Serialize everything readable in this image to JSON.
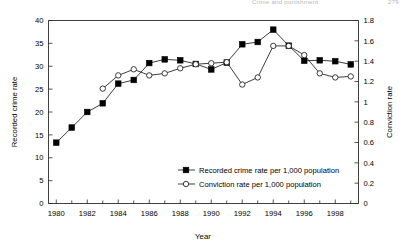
{
  "running_head": {
    "title": "Crime and punishment",
    "page": "279"
  },
  "chart_data": {
    "type": "line",
    "title": "",
    "xlabel": "Year",
    "ylabel": "Recorded crime rate",
    "y2label": "Conviction rate",
    "x": [
      1980,
      1981,
      1982,
      1983,
      1984,
      1985,
      1986,
      1987,
      1988,
      1989,
      1990,
      1991,
      1992,
      1993,
      1994,
      1995,
      1996,
      1997,
      1998,
      1999
    ],
    "xlim": [
      1979.5,
      1999.5
    ],
    "ylim": [
      0,
      40
    ],
    "y2lim": [
      0,
      1.8
    ],
    "ytick_labels": [
      "0",
      "5",
      "10",
      "15",
      "20",
      "25",
      "30",
      "35",
      "40"
    ],
    "ytick_values": [
      0,
      5,
      10,
      15,
      20,
      25,
      30,
      35,
      40
    ],
    "y2tick_labels": [
      "0",
      "0.2",
      "0.4",
      "0.6",
      "0.8",
      "1",
      "1.2",
      "1.4",
      "1.6",
      "1.8"
    ],
    "y2tick_values": [
      0,
      0.2,
      0.4,
      0.6,
      0.8,
      1.0,
      1.2,
      1.4,
      1.6,
      1.8
    ],
    "xtick_labels": [
      "1980",
      "1982",
      "1984",
      "1986",
      "1988",
      "1990",
      "1992",
      "1994",
      "1996",
      "1998"
    ],
    "xtick_values": [
      1980,
      1982,
      1984,
      1986,
      1988,
      1990,
      1992,
      1994,
      1996,
      1998
    ],
    "xtick_minor_values": [
      1981,
      1983,
      1985,
      1987,
      1989,
      1991,
      1993,
      1995,
      1997,
      1999
    ],
    "grid": false,
    "legend_position": "inside-center-lower",
    "series": [
      {
        "name": "Recorded crime rate per 1,000 population",
        "axis": "left",
        "marker": "filled-square",
        "color": "#000000",
        "x": [
          1980,
          1981,
          1982,
          1983,
          1984,
          1985,
          1986,
          1987,
          1988,
          1989,
          1990,
          1991,
          1992,
          1993,
          1994,
          1995,
          1996,
          1997,
          1998,
          1999
        ],
        "values": [
          13.3,
          16.6,
          20.0,
          21.9,
          26.2,
          27.0,
          30.7,
          31.5,
          31.3,
          30.5,
          29.3,
          30.8,
          34.8,
          35.3,
          38.0,
          34.5,
          31.2,
          31.3,
          31.1,
          30.4
        ]
      },
      {
        "name": "Conviction rate per 1,000 population",
        "axis": "right",
        "marker": "open-circle",
        "color": "#ffffff",
        "x": [
          1983,
          1984,
          1985,
          1986,
          1987,
          1988,
          1989,
          1990,
          1991,
          1992,
          1993,
          1994,
          1995,
          1996,
          1997,
          1998,
          1999
        ],
        "values": [
          1.13,
          1.26,
          1.32,
          1.26,
          1.28,
          1.33,
          1.37,
          1.38,
          1.39,
          1.17,
          1.24,
          1.55,
          1.55,
          1.46,
          1.28,
          1.24,
          1.25
        ],
        "values_left_scale": [
          25.1,
          28.1,
          29.3,
          28.0,
          28.5,
          29.6,
          30.5,
          30.6,
          30.9,
          26.0,
          27.6,
          34.4,
          34.4,
          32.5,
          28.4,
          27.6,
          27.9
        ]
      }
    ]
  },
  "legend": {
    "entries": [
      {
        "label": "Recorded crime rate per 1,000 population",
        "marker": "filled-square"
      },
      {
        "label": "Conviction rate per 1,000 population",
        "marker": "open-circle"
      }
    ]
  }
}
